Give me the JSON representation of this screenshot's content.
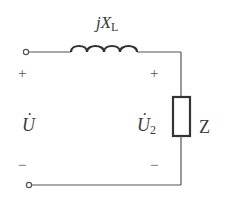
{
  "diagram": {
    "type": "circuit",
    "title": "",
    "colors": {
      "wire": "#555555",
      "text": "#3a3a3a",
      "background": "#ffffff"
    },
    "components": [
      {
        "id": "inductor",
        "symbol": "inductor-coil",
        "label": "jX",
        "label_sub": "L"
      },
      {
        "id": "load",
        "symbol": "impedance-box",
        "label": "Z"
      }
    ],
    "terminals": [
      {
        "id": "input-top",
        "polarity": "+"
      },
      {
        "id": "input-bottom",
        "polarity": "−"
      }
    ],
    "voltages": [
      {
        "id": "source",
        "symbol": "U",
        "subscript": "",
        "plus": "+",
        "minus": "−"
      },
      {
        "id": "load-voltage",
        "symbol": "U",
        "subscript": "2",
        "plus": "+",
        "minus": "−"
      }
    ]
  }
}
